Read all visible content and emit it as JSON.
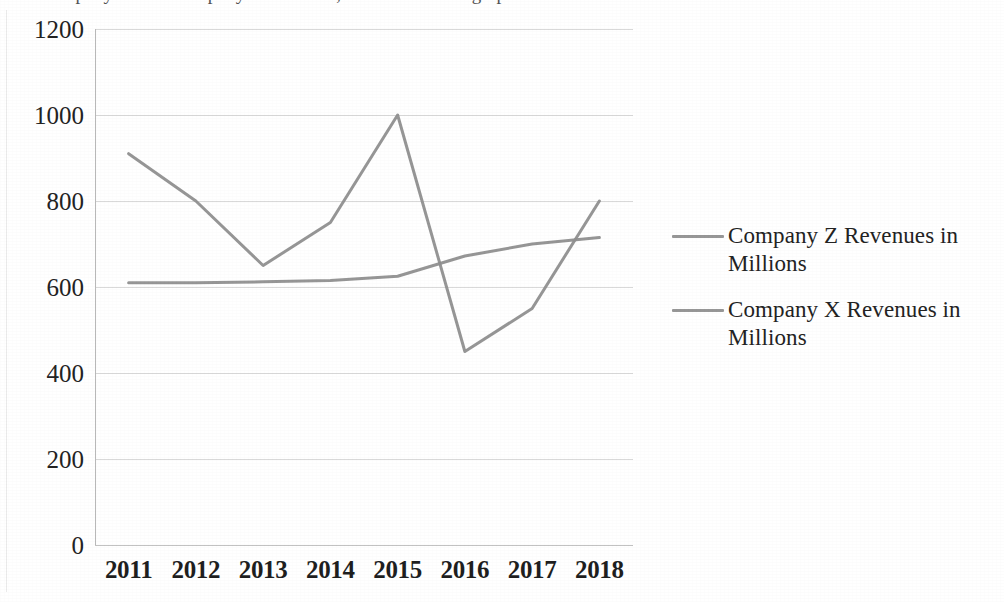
{
  "caption": {
    "text": "Company X and Company Z revenues, as shown in the graph below:"
  },
  "chart_data": {
    "type": "line",
    "title": "",
    "subtitle": "",
    "xlabel": "",
    "ylabel": "",
    "categories": [
      "2011",
      "2012",
      "2013",
      "2014",
      "2015",
      "2016",
      "2017",
      "2018"
    ],
    "x": [
      2011,
      2012,
      2013,
      2014,
      2015,
      2016,
      2017,
      2018
    ],
    "series": [
      {
        "name": "Company Z Revenues in Millions",
        "color": "#8e8e8e",
        "values": [
          910,
          800,
          650,
          750,
          1000,
          450,
          550,
          800
        ]
      },
      {
        "name": "Company X Revenues in Millions",
        "color": "#8e8e8e",
        "values": [
          610,
          610,
          612,
          615,
          625,
          672,
          700,
          715
        ]
      }
    ],
    "ylim": [
      0,
      1200
    ],
    "yticks": [
      0,
      200,
      400,
      600,
      800,
      1000,
      1200
    ],
    "ytick_labels": [
      "0",
      "200",
      "400",
      "600",
      "800",
      "1000",
      "1200"
    ],
    "grid": "horizontal",
    "legend_position": "right",
    "markers": false,
    "line_width": 3
  },
  "axis": {
    "y_labels": [
      "1200",
      "1000",
      "800",
      "600",
      "400",
      "200",
      "0"
    ],
    "x_labels": [
      "2011",
      "2012",
      "2013",
      "2014",
      "2015",
      "2016",
      "2017",
      "2018"
    ]
  },
  "legend": {
    "entries": [
      {
        "label": "Company Z Revenues in Millions",
        "color": "#8e8e8e"
      },
      {
        "label": "Company X Revenues in Millions",
        "color": "#8e8e8e"
      }
    ]
  },
  "colors": {
    "series_gray": "#8e8e8e",
    "grid_gray": "#d2d2d2",
    "text": "#232323",
    "background": "#ffffff"
  }
}
